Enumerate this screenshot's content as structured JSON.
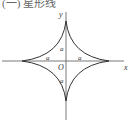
{
  "caption": "(一) 星形线",
  "diagram": {
    "type": "astroid",
    "axes": {
      "x_label": "x",
      "y_label": "y",
      "origin_label": "O"
    },
    "segment_labels": [
      "a",
      "a",
      "a",
      "a"
    ],
    "colors": {
      "curve": "#333333",
      "axis": "#444444",
      "background": "#ffffff"
    }
  }
}
